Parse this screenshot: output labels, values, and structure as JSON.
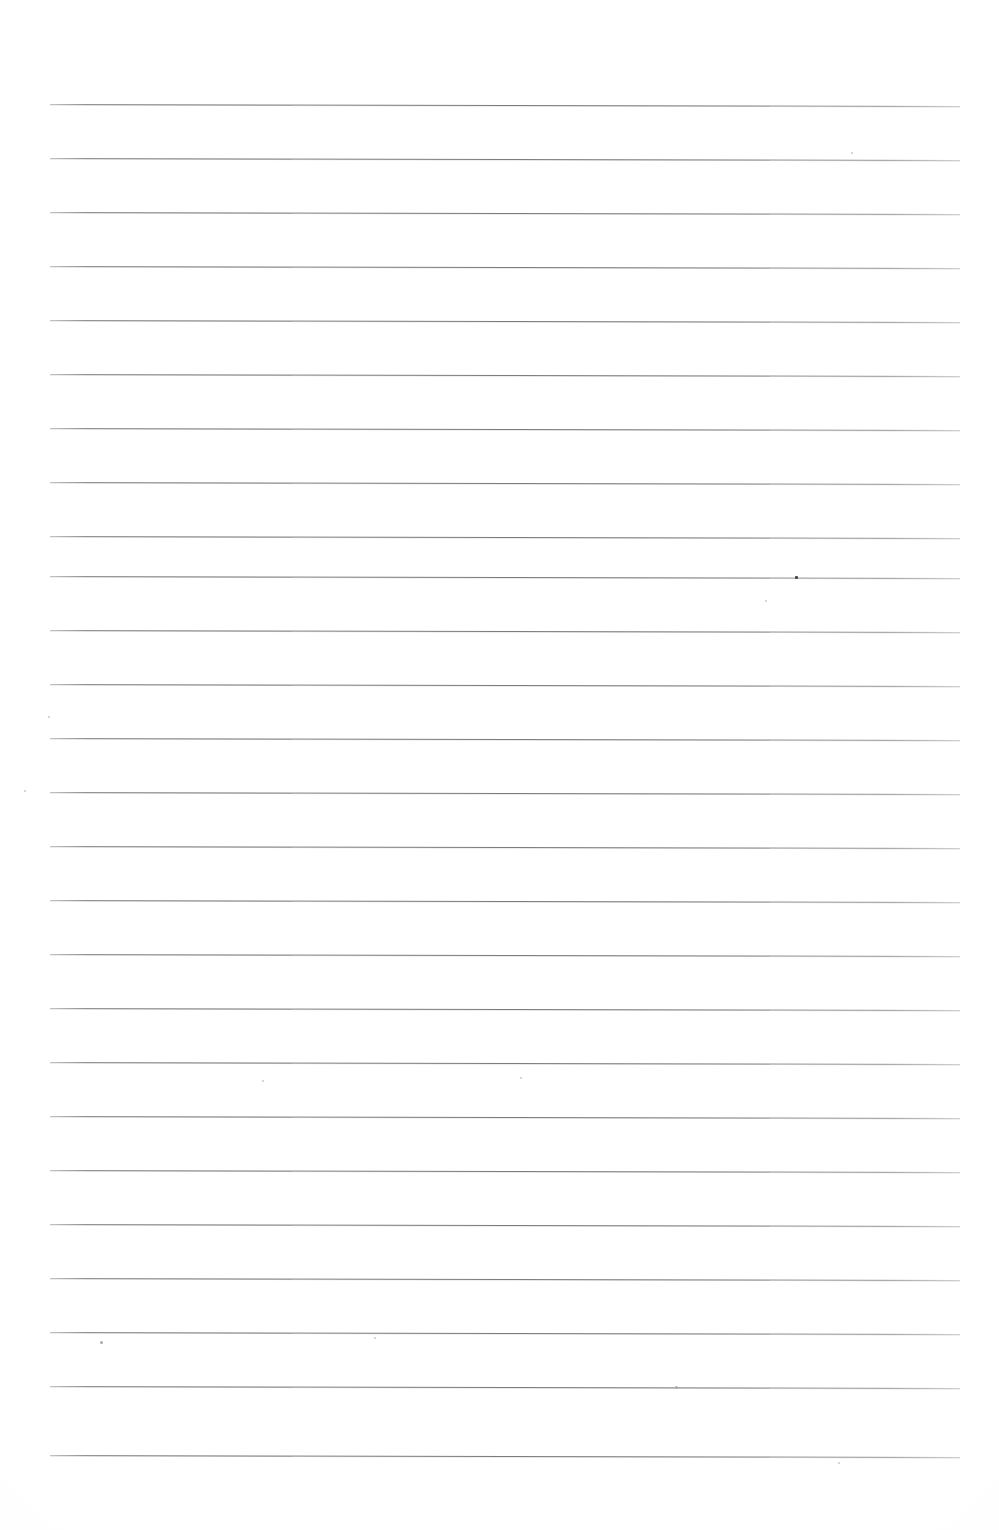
{
  "document": {
    "kind": "scanned-blank-ruled-page",
    "title": "Blank Ruled Notebook Page",
    "page_width": 999,
    "page_height": 1530,
    "background_color": "#ffffff",
    "text_content": "",
    "handwriting_present": false,
    "printed_text_present": false
  },
  "ruling": {
    "line_color": "#808080",
    "line_thickness_px": 1,
    "line_count": 26,
    "left_margin_px": 50,
    "right_edge_px": 960,
    "line_length_px": 910,
    "first_line_y_px": 104,
    "line_spacing_px": 54,
    "skew_degrees": 0.12,
    "margin_rule_present": false,
    "lines_y": [
      104,
      158,
      212,
      266,
      320,
      374,
      428,
      482,
      536,
      576,
      630,
      684,
      738,
      792,
      846,
      900,
      954,
      1008,
      1062,
      1116,
      1170,
      1224,
      1278,
      1332,
      1386,
      1455
    ]
  },
  "artifacts": {
    "description": "scanner dust specks and paper flecks",
    "specks": [
      {
        "name": "speck-top-right",
        "x": 851,
        "y": 152,
        "size": 2,
        "tone": "faint"
      },
      {
        "name": "speck-dark-on-line",
        "x": 795,
        "y": 576,
        "size": 3,
        "tone": "dark"
      },
      {
        "name": "speck-below-line-right",
        "x": 765,
        "y": 600,
        "size": 2,
        "tone": "faint"
      },
      {
        "name": "speck-left-margin",
        "x": 48,
        "y": 716,
        "size": 2,
        "tone": "faint"
      },
      {
        "name": "speck-left-edge-mid",
        "x": 24,
        "y": 790,
        "size": 2,
        "tone": "faint"
      },
      {
        "name": "speck-center-lower",
        "x": 262,
        "y": 1080,
        "size": 2,
        "tone": "faint"
      },
      {
        "name": "speck-center-lower-b",
        "x": 520,
        "y": 1077,
        "size": 2,
        "tone": "faint"
      },
      {
        "name": "speck-bottom-left",
        "x": 100,
        "y": 1341,
        "size": 3,
        "tone": "mid"
      },
      {
        "name": "speck-bottom-mid",
        "x": 374,
        "y": 1337,
        "size": 2,
        "tone": "faint"
      },
      {
        "name": "speck-bottom-center",
        "x": 675,
        "y": 1386,
        "size": 3,
        "tone": "mid"
      },
      {
        "name": "speck-bottom-right",
        "x": 838,
        "y": 1462,
        "size": 2,
        "tone": "faint"
      }
    ]
  }
}
